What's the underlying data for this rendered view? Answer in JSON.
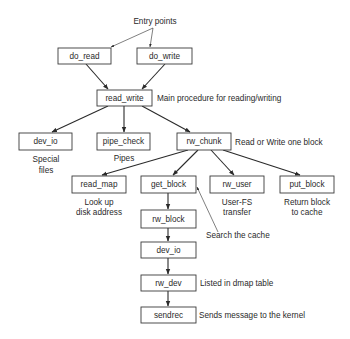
{
  "diagram": {
    "entry_label": "Entry points",
    "nodes": [
      {
        "id": "do_read",
        "label": "do_read"
      },
      {
        "id": "do_write",
        "label": "do_write"
      },
      {
        "id": "read_write",
        "label": "read_write"
      },
      {
        "id": "dev_io_1",
        "label": "dev_io"
      },
      {
        "id": "pipe_check",
        "label": "pipe_check"
      },
      {
        "id": "rw_chunk",
        "label": "rw_chunk"
      },
      {
        "id": "read_map",
        "label": "read_map"
      },
      {
        "id": "get_block",
        "label": "get_block"
      },
      {
        "id": "rw_user",
        "label": "rw_user"
      },
      {
        "id": "put_block",
        "label": "put_block"
      },
      {
        "id": "rw_block",
        "label": "rw_block"
      },
      {
        "id": "dev_io_2",
        "label": "dev_io"
      },
      {
        "id": "rw_dev",
        "label": "rw_dev"
      },
      {
        "id": "sendrec",
        "label": "sendrec"
      }
    ],
    "edges": [
      {
        "from": "entry",
        "to": "do_read"
      },
      {
        "from": "entry",
        "to": "do_write"
      },
      {
        "from": "do_read",
        "to": "read_write"
      },
      {
        "from": "do_write",
        "to": "read_write"
      },
      {
        "from": "read_write",
        "to": "dev_io_1"
      },
      {
        "from": "read_write",
        "to": "pipe_check"
      },
      {
        "from": "read_write",
        "to": "rw_chunk"
      },
      {
        "from": "rw_chunk",
        "to": "read_map"
      },
      {
        "from": "rw_chunk",
        "to": "get_block"
      },
      {
        "from": "rw_chunk",
        "to": "rw_user"
      },
      {
        "from": "rw_chunk",
        "to": "put_block"
      },
      {
        "from": "get_block",
        "to": "rw_block"
      },
      {
        "from": "rw_block",
        "to": "dev_io_2"
      },
      {
        "from": "dev_io_2",
        "to": "rw_dev"
      },
      {
        "from": "rw_dev",
        "to": "sendrec"
      }
    ],
    "annotations": {
      "read_write": "Main procedure for reading/writing",
      "dev_io_1": [
        "Special",
        "files"
      ],
      "pipe_check": [
        "Pipes"
      ],
      "rw_chunk": "Read or Write one block",
      "read_map": [
        "Look up",
        "disk address"
      ],
      "rw_user": [
        "User-FS",
        "transfer"
      ],
      "put_block": [
        "Return block",
        "to cache"
      ],
      "get_block": "Search the cache",
      "rw_dev": "Listed in dmap table",
      "sendrec": "Sends message to the kernel"
    }
  }
}
